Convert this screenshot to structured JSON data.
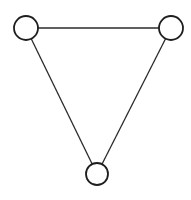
{
  "diagram": {
    "type": "graph",
    "canvas": {
      "width": 191,
      "height": 200,
      "background": "#ffffff"
    },
    "style": {
      "line_color": "#2a2a2a",
      "node_stroke": "#1e1e1e",
      "node_fill": "#ffffff"
    },
    "nodes": [
      {
        "id": "n1",
        "label": "",
        "cx": 26,
        "cy": 28,
        "r": 12
      },
      {
        "id": "n2",
        "label": "",
        "cx": 171,
        "cy": 28,
        "r": 12
      },
      {
        "id": "n3",
        "label": "",
        "cx": 97,
        "cy": 174,
        "r": 11
      }
    ],
    "edges": [
      {
        "from": "n1",
        "to": "n2"
      },
      {
        "from": "n1",
        "to": "n3"
      },
      {
        "from": "n2",
        "to": "n3"
      }
    ]
  }
}
